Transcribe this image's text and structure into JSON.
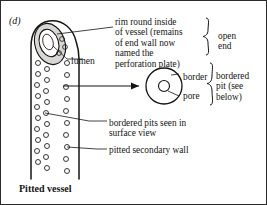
{
  "figure": {
    "panel_letter": "(d)",
    "caption": "Pitted vessel",
    "background_color": "#ffffff",
    "ink_color": "#141414",
    "shading_color": "#d8d6d2"
  },
  "labels": {
    "lumen": "lumen",
    "rim": "rim round inside\nof vessel (remains\nof end wall now\nnamed the\nperforation plate)",
    "open_end": "open\nend",
    "border": "border",
    "pore": "pore",
    "bordered_pit": "bordered\npit (see\nbelow)",
    "surface_view": "bordered pits seen in\nsurface view",
    "secondary_wall": "pitted secondary wall"
  },
  "diagram": {
    "vessel": {
      "name": "pitted-vessel-drawing",
      "tip_opening": "elliptical perforation plate with rim",
      "wall_left_x": 30,
      "wall_right_x": 78,
      "top_y": 20,
      "bottom_y": 178,
      "pit_columns": 3,
      "pit_count": 34
    },
    "bordered_pit_detail": {
      "name": "bordered-pit-surface-view",
      "center_x": 163,
      "center_y": 85,
      "outer_radius": 18,
      "inner_radius": 5.5
    },
    "arrow": {
      "name": "detail-pointer-arrow",
      "from_x": 62,
      "from_y": 85,
      "to_x": 142,
      "to_y": 85
    }
  }
}
